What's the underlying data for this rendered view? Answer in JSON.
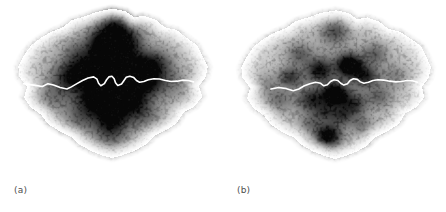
{
  "figure": {
    "title": "",
    "background_color": "#ffffff",
    "width": 446,
    "height": 212,
    "panel_count": 2
  },
  "panels": [
    {
      "id": "a",
      "label": "(a)",
      "caption": "",
      "map_region": "Greater London",
      "overlay_name": "River Thames",
      "overlay_color": "#ffffff",
      "colormap": "grayscale-inverted",
      "background_color": "#ffffff"
    },
    {
      "id": "b",
      "label": "(b)",
      "caption": "",
      "map_region": "Greater London",
      "overlay_name": "River Thames",
      "overlay_color": "#ffffff",
      "colormap": "grayscale-inverted",
      "background_color": "#ffffff"
    }
  ],
  "chart_data": {
    "type": "heatmap",
    "title": "",
    "subtitle": "",
    "xlabel": "",
    "ylabel": "",
    "grid": false,
    "legend": "none",
    "colormap": "grayscale-inverted",
    "value_min": 0,
    "value_max": 1,
    "panels": [
      {
        "id": "a",
        "label": "(a)",
        "description": "Continuous radial/cross-shaped density surface over the Greater London road network, darkest along a central north-south and east-west corridor crossing the River Thames.",
        "speckle_seed": 11,
        "speckle_count": 2600,
        "hotspots": [
          {
            "x": 0.5,
            "y": 0.395,
            "r": 0.075,
            "v": 1.0
          },
          {
            "x": 0.505,
            "y": 0.52,
            "r": 0.08,
            "v": 0.96
          },
          {
            "x": 0.48,
            "y": 0.3,
            "r": 0.07,
            "v": 0.72
          },
          {
            "x": 0.525,
            "y": 0.2,
            "r": 0.085,
            "v": 0.55
          },
          {
            "x": 0.515,
            "y": 0.12,
            "r": 0.08,
            "v": 0.38
          },
          {
            "x": 0.5,
            "y": 0.64,
            "r": 0.08,
            "v": 0.62
          },
          {
            "x": 0.495,
            "y": 0.74,
            "r": 0.075,
            "v": 0.4
          },
          {
            "x": 0.375,
            "y": 0.415,
            "r": 0.075,
            "v": 0.58
          },
          {
            "x": 0.3,
            "y": 0.43,
            "r": 0.075,
            "v": 0.42
          },
          {
            "x": 0.625,
            "y": 0.385,
            "r": 0.075,
            "v": 0.6
          },
          {
            "x": 0.7,
            "y": 0.36,
            "r": 0.075,
            "v": 0.44
          },
          {
            "x": 0.66,
            "y": 0.47,
            "r": 0.065,
            "v": 0.46
          },
          {
            "x": 0.405,
            "y": 0.56,
            "r": 0.07,
            "v": 0.45
          },
          {
            "x": 0.6,
            "y": 0.56,
            "r": 0.065,
            "v": 0.4
          },
          {
            "x": 0.445,
            "y": 0.225,
            "r": 0.06,
            "v": 0.4
          },
          {
            "x": 0.58,
            "y": 0.25,
            "r": 0.06,
            "v": 0.36
          },
          {
            "x": 0.35,
            "y": 0.3,
            "r": 0.07,
            "v": 0.3
          },
          {
            "x": 0.64,
            "y": 0.64,
            "r": 0.07,
            "v": 0.28
          },
          {
            "x": 0.36,
            "y": 0.66,
            "r": 0.07,
            "v": 0.28
          },
          {
            "x": 0.24,
            "y": 0.54,
            "r": 0.08,
            "v": 0.24
          },
          {
            "x": 0.77,
            "y": 0.47,
            "r": 0.08,
            "v": 0.22
          },
          {
            "x": 0.5,
            "y": 0.45,
            "r": 0.23,
            "v": 0.34
          },
          {
            "x": 0.5,
            "y": 0.45,
            "r": 0.4,
            "v": 0.17
          }
        ],
        "cloud_outline": [
          [
            0.5,
            0.045
          ],
          [
            0.56,
            0.06
          ],
          [
            0.6,
            0.095
          ],
          [
            0.64,
            0.085
          ],
          [
            0.7,
            0.11
          ],
          [
            0.735,
            0.15
          ],
          [
            0.79,
            0.165
          ],
          [
            0.835,
            0.21
          ],
          [
            0.88,
            0.25
          ],
          [
            0.905,
            0.31
          ],
          [
            0.93,
            0.37
          ],
          [
            0.92,
            0.43
          ],
          [
            0.89,
            0.48
          ],
          [
            0.905,
            0.54
          ],
          [
            0.87,
            0.595
          ],
          [
            0.82,
            0.63
          ],
          [
            0.79,
            0.69
          ],
          [
            0.74,
            0.73
          ],
          [
            0.69,
            0.76
          ],
          [
            0.65,
            0.81
          ],
          [
            0.6,
            0.845
          ],
          [
            0.545,
            0.87
          ],
          [
            0.5,
            0.885
          ],
          [
            0.455,
            0.87
          ],
          [
            0.405,
            0.845
          ],
          [
            0.355,
            0.81
          ],
          [
            0.315,
            0.765
          ],
          [
            0.265,
            0.735
          ],
          [
            0.215,
            0.695
          ],
          [
            0.18,
            0.64
          ],
          [
            0.135,
            0.6
          ],
          [
            0.105,
            0.545
          ],
          [
            0.12,
            0.485
          ],
          [
            0.085,
            0.43
          ],
          [
            0.08,
            0.37
          ],
          [
            0.105,
            0.31
          ],
          [
            0.135,
            0.255
          ],
          [
            0.18,
            0.21
          ],
          [
            0.23,
            0.175
          ],
          [
            0.28,
            0.15
          ],
          [
            0.32,
            0.11
          ],
          [
            0.375,
            0.09
          ],
          [
            0.43,
            0.065
          ]
        ],
        "river_path": [
          [
            0.105,
            0.47
          ],
          [
            0.15,
            0.478
          ],
          [
            0.19,
            0.486
          ],
          [
            0.215,
            0.47
          ],
          [
            0.24,
            0.478
          ],
          [
            0.27,
            0.492
          ],
          [
            0.3,
            0.5
          ],
          [
            0.32,
            0.488
          ],
          [
            0.345,
            0.47
          ],
          [
            0.37,
            0.452
          ],
          [
            0.395,
            0.438
          ],
          [
            0.42,
            0.432
          ],
          [
            0.435,
            0.445
          ],
          [
            0.442,
            0.468
          ],
          [
            0.452,
            0.482
          ],
          [
            0.468,
            0.47
          ],
          [
            0.478,
            0.448
          ],
          [
            0.488,
            0.432
          ],
          [
            0.502,
            0.428
          ],
          [
            0.512,
            0.442
          ],
          [
            0.518,
            0.465
          ],
          [
            0.528,
            0.48
          ],
          [
            0.545,
            0.472
          ],
          [
            0.556,
            0.452
          ],
          [
            0.566,
            0.434
          ],
          [
            0.582,
            0.428
          ],
          [
            0.6,
            0.436
          ],
          [
            0.612,
            0.452
          ],
          [
            0.626,
            0.462
          ],
          [
            0.645,
            0.458
          ],
          [
            0.665,
            0.448
          ],
          [
            0.69,
            0.442
          ],
          [
            0.715,
            0.444
          ],
          [
            0.742,
            0.452
          ],
          [
            0.768,
            0.458
          ],
          [
            0.795,
            0.456
          ],
          [
            0.82,
            0.45
          ],
          [
            0.845,
            0.452
          ],
          [
            0.868,
            0.46
          ]
        ]
      },
      {
        "id": "b",
        "label": "(b)",
        "description": "Discrete, separated density blobs over the Greater London road network; hotspots are more punctate and scattered than in panel (a).",
        "speckle_seed": 29,
        "speckle_count": 2600,
        "hotspots": [
          {
            "x": 0.565,
            "y": 0.365,
            "r": 0.055,
            "v": 1.0
          },
          {
            "x": 0.5,
            "y": 0.53,
            "r": 0.055,
            "v": 0.94
          },
          {
            "x": 0.47,
            "y": 0.76,
            "r": 0.058,
            "v": 0.9
          },
          {
            "x": 0.43,
            "y": 0.39,
            "r": 0.055,
            "v": 0.62
          },
          {
            "x": 0.64,
            "y": 0.425,
            "r": 0.052,
            "v": 0.55
          },
          {
            "x": 0.395,
            "y": 0.56,
            "r": 0.06,
            "v": 0.52
          },
          {
            "x": 0.3,
            "y": 0.43,
            "r": 0.05,
            "v": 0.5
          },
          {
            "x": 0.585,
            "y": 0.585,
            "r": 0.055,
            "v": 0.48
          },
          {
            "x": 0.5,
            "y": 0.175,
            "r": 0.06,
            "v": 0.44
          },
          {
            "x": 0.53,
            "y": 0.65,
            "r": 0.05,
            "v": 0.42
          },
          {
            "x": 0.34,
            "y": 0.3,
            "r": 0.055,
            "v": 0.34
          },
          {
            "x": 0.68,
            "y": 0.3,
            "r": 0.055,
            "v": 0.34
          },
          {
            "x": 0.7,
            "y": 0.54,
            "r": 0.055,
            "v": 0.3
          },
          {
            "x": 0.25,
            "y": 0.56,
            "r": 0.06,
            "v": 0.28
          },
          {
            "x": 0.455,
            "y": 0.63,
            "r": 0.048,
            "v": 0.36
          },
          {
            "x": 0.62,
            "y": 0.7,
            "r": 0.05,
            "v": 0.26
          },
          {
            "x": 0.39,
            "y": 0.69,
            "r": 0.05,
            "v": 0.26
          },
          {
            "x": 0.77,
            "y": 0.42,
            "r": 0.06,
            "v": 0.22
          },
          {
            "x": 0.19,
            "y": 0.47,
            "r": 0.06,
            "v": 0.2
          },
          {
            "x": 0.5,
            "y": 0.46,
            "r": 0.25,
            "v": 0.22
          },
          {
            "x": 0.5,
            "y": 0.46,
            "r": 0.42,
            "v": 0.13
          }
        ],
        "cloud_outline": [
          [
            0.505,
            0.055
          ],
          [
            0.56,
            0.07
          ],
          [
            0.6,
            0.105
          ],
          [
            0.645,
            0.095
          ],
          [
            0.7,
            0.12
          ],
          [
            0.74,
            0.16
          ],
          [
            0.79,
            0.175
          ],
          [
            0.84,
            0.215
          ],
          [
            0.885,
            0.255
          ],
          [
            0.91,
            0.315
          ],
          [
            0.93,
            0.375
          ],
          [
            0.92,
            0.435
          ],
          [
            0.89,
            0.485
          ],
          [
            0.9,
            0.545
          ],
          [
            0.865,
            0.6
          ],
          [
            0.815,
            0.635
          ],
          [
            0.785,
            0.695
          ],
          [
            0.735,
            0.735
          ],
          [
            0.685,
            0.765
          ],
          [
            0.645,
            0.815
          ],
          [
            0.595,
            0.85
          ],
          [
            0.545,
            0.875
          ],
          [
            0.5,
            0.89
          ],
          [
            0.455,
            0.875
          ],
          [
            0.405,
            0.85
          ],
          [
            0.355,
            0.815
          ],
          [
            0.315,
            0.77
          ],
          [
            0.265,
            0.74
          ],
          [
            0.215,
            0.7
          ],
          [
            0.18,
            0.645
          ],
          [
            0.135,
            0.605
          ],
          [
            0.105,
            0.55
          ],
          [
            0.12,
            0.49
          ],
          [
            0.085,
            0.435
          ],
          [
            0.08,
            0.375
          ],
          [
            0.105,
            0.315
          ],
          [
            0.135,
            0.26
          ],
          [
            0.18,
            0.215
          ],
          [
            0.23,
            0.18
          ],
          [
            0.28,
            0.155
          ],
          [
            0.325,
            0.115
          ],
          [
            0.38,
            0.095
          ],
          [
            0.435,
            0.07
          ]
        ],
        "river_path": [
          [
            0.215,
            0.5
          ],
          [
            0.25,
            0.492
          ],
          [
            0.285,
            0.498
          ],
          [
            0.315,
            0.51
          ],
          [
            0.34,
            0.5
          ],
          [
            0.365,
            0.482
          ],
          [
            0.39,
            0.47
          ],
          [
            0.415,
            0.462
          ],
          [
            0.438,
            0.468
          ],
          [
            0.452,
            0.482
          ],
          [
            0.468,
            0.476
          ],
          [
            0.482,
            0.458
          ],
          [
            0.498,
            0.448
          ],
          [
            0.515,
            0.452
          ],
          [
            0.528,
            0.468
          ],
          [
            0.542,
            0.478
          ],
          [
            0.558,
            0.47
          ],
          [
            0.57,
            0.452
          ],
          [
            0.585,
            0.442
          ],
          [
            0.602,
            0.446
          ],
          [
            0.616,
            0.46
          ],
          [
            0.632,
            0.468
          ],
          [
            0.652,
            0.462
          ],
          [
            0.672,
            0.452
          ],
          [
            0.695,
            0.448
          ],
          [
            0.72,
            0.45
          ],
          [
            0.748,
            0.456
          ],
          [
            0.775,
            0.46
          ],
          [
            0.8,
            0.458
          ],
          [
            0.826,
            0.452
          ],
          [
            0.85,
            0.454
          ],
          [
            0.872,
            0.462
          ]
        ]
      }
    ]
  }
}
